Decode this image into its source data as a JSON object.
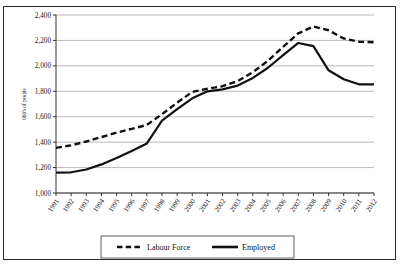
{
  "chart_data": {
    "type": "line",
    "title": "",
    "xlabel": "",
    "ylabel": "000's of people",
    "ylim": [
      1000,
      2400
    ],
    "ytick_step": 200,
    "ytick_labels": [
      "2,400",
      "2,200",
      "2,000",
      "1,800",
      "1,600",
      "1,400",
      "1,200",
      "1,000"
    ],
    "grid": "horizontal",
    "legend_position": "bottom",
    "categories": [
      "1991",
      "1992",
      "1993",
      "1994",
      "1995",
      "1996",
      "1997",
      "1998",
      "1999",
      "2000",
      "2001",
      "2002",
      "2003",
      "2004",
      "2005",
      "2006",
      "2007",
      "2008",
      "2009",
      "2010",
      "2011",
      "2012"
    ],
    "series": [
      {
        "name": "Labour Force",
        "style": "dashed",
        "color": "#111111",
        "values": [
          1355,
          1375,
          1405,
          1440,
          1475,
          1505,
          1535,
          1620,
          1710,
          1795,
          1820,
          1840,
          1880,
          1950,
          2040,
          2150,
          2255,
          2310,
          2280,
          2215,
          2190,
          2185
        ]
      },
      {
        "name": "Employed",
        "style": "solid",
        "color": "#111111",
        "values": [
          1160,
          1163,
          1185,
          1225,
          1275,
          1330,
          1390,
          1570,
          1660,
          1745,
          1800,
          1815,
          1845,
          1905,
          1985,
          2085,
          2180,
          2155,
          1965,
          1895,
          1855,
          1855
        ]
      }
    ]
  },
  "legend": {
    "items": [
      {
        "label": "Labour Force",
        "style": "dashed"
      },
      {
        "label": "Employed",
        "style": "solid"
      }
    ]
  },
  "axis": {
    "y_title": "000's of people"
  }
}
